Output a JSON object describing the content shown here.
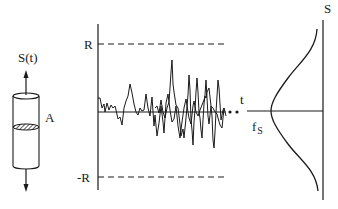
{
  "figure": {
    "type": "diagram",
    "cylinder": {
      "load_label": "S(t)",
      "area_label": "A"
    },
    "signal_plot": {
      "upper_bound_label": "R",
      "lower_bound_label": "-R",
      "time_axis_label": "t",
      "continuation": "• •"
    },
    "distribution": {
      "density_label": "f",
      "density_subscript": "S",
      "axis_label": "S"
    },
    "colors": {
      "ink": "#1a1a1a",
      "background": "#ffffff"
    }
  }
}
